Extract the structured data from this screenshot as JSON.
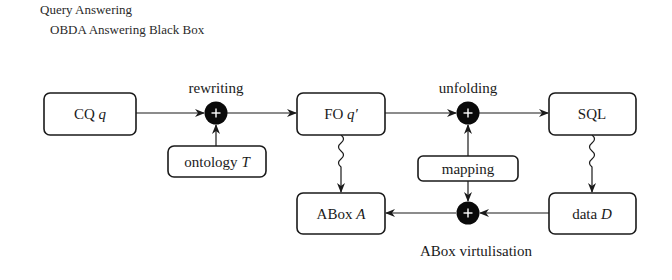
{
  "header": {
    "title": "Query Answering",
    "subtitle": "OBDA Answering Black Box"
  },
  "diagram": {
    "nodes": {
      "cq": {
        "text": "CQ ",
        "var": "q"
      },
      "ontology": {
        "text": "ontology ",
        "var": "T"
      },
      "fo": {
        "text": "FO ",
        "var": "q′"
      },
      "sql": {
        "text": "SQL",
        "var": ""
      },
      "mapping": {
        "text": "mapping",
        "var": ""
      },
      "abox": {
        "text": "ABox ",
        "var": "A"
      },
      "data": {
        "text": "data ",
        "var": "D"
      }
    },
    "operators": {
      "rewriting": {
        "label": "rewriting",
        "symbol": "+"
      },
      "unfolding": {
        "label": "unfolding",
        "symbol": "+"
      },
      "virtualisation": {
        "label": "ABox virtulisation",
        "symbol": "+"
      }
    },
    "edges": [
      {
        "from": "cq",
        "to": "rewriting",
        "style": "arrow"
      },
      {
        "from": "ontology",
        "to": "rewriting",
        "style": "arrow"
      },
      {
        "from": "rewriting",
        "to": "fo",
        "style": "arrow"
      },
      {
        "from": "fo",
        "to": "unfolding",
        "style": "arrow"
      },
      {
        "from": "mapping",
        "to": "unfolding",
        "style": "arrow"
      },
      {
        "from": "unfolding",
        "to": "sql",
        "style": "arrow"
      },
      {
        "from": "fo",
        "to": "abox",
        "style": "wavy-arrow"
      },
      {
        "from": "sql",
        "to": "data",
        "style": "wavy-arrow"
      },
      {
        "from": "mapping",
        "to": "virtualisation",
        "style": "arrow"
      },
      {
        "from": "data",
        "to": "virtualisation",
        "style": "arrow"
      },
      {
        "from": "virtualisation",
        "to": "abox",
        "style": "arrow"
      }
    ]
  }
}
